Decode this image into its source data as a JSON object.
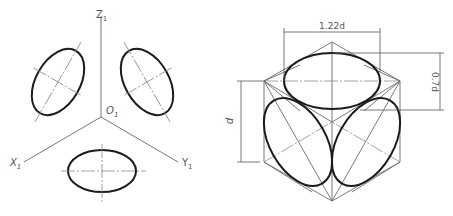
{
  "figure_left": {
    "title": "Isometric axes with circles on three planes",
    "labels": {
      "z_axis": "Z",
      "z_sub": "1",
      "x_axis": "X",
      "x_sub": "1",
      "y_axis": "Y",
      "y_sub": "1",
      "origin": "O",
      "origin_sub": "1"
    }
  },
  "figure_right": {
    "title": "Approximate ellipses inscribed in isometric cube faces",
    "dimensions": {
      "major_axis": "1.22d",
      "minor_axis": "0.7d",
      "diameter": "d"
    }
  },
  "colors": {
    "outline": "#1c1c1c",
    "thin_line": "#6a6a6a",
    "text": "#555555",
    "background": "#ffffff"
  }
}
